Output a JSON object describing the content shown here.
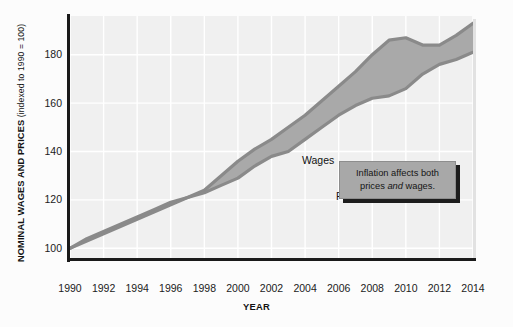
{
  "chart_data": {
    "type": "area",
    "title": "",
    "xlabel": "YEAR",
    "ylabel": "NOMINAL WAGES AND PRICES",
    "ylabel_note": "(indexed to 1990 = 100)",
    "xlim": [
      1990,
      2014
    ],
    "ylim": [
      96,
      196
    ],
    "yticks": [
      100,
      120,
      140,
      160,
      180
    ],
    "xticks": [
      1990,
      1992,
      1994,
      1996,
      1998,
      2000,
      2002,
      2004,
      2006,
      2008,
      2010,
      2012,
      2014
    ],
    "grid": true,
    "legend_position": "inline-labels",
    "x": [
      1990,
      1991,
      1992,
      1993,
      1994,
      1995,
      1996,
      1997,
      1998,
      1999,
      2000,
      2001,
      2002,
      2003,
      2004,
      2005,
      2006,
      2007,
      2008,
      2009,
      2010,
      2011,
      2012,
      2013,
      2014
    ],
    "series": [
      {
        "name": "Wages",
        "color": "#8a8a8a",
        "values": [
          100,
          104,
          107,
          110,
          113,
          116,
          119,
          121,
          124,
          130,
          136,
          141,
          145,
          150,
          155,
          161,
          167,
          173,
          180,
          186,
          187,
          184,
          184,
          188,
          193
        ]
      },
      {
        "name": "Prices",
        "color": "#8a8a8a",
        "values": [
          100,
          103,
          106,
          109,
          112,
          115,
          118,
          121,
          123,
          126,
          129,
          134,
          138,
          140,
          145,
          150,
          155,
          159,
          162,
          163,
          166,
          172,
          176,
          178,
          181
        ]
      }
    ],
    "band_fill": "#a9a9a9",
    "panel_background": "#f0f0f0",
    "gridline_color": "#ffffff",
    "annotations": [
      {
        "name": "inflation-callout",
        "line1": "Inflation affects both",
        "line2_pre": "prices ",
        "line2_em": "and",
        "line2_post": " wages."
      }
    ]
  },
  "labels": {
    "ylabel_main": "NOMINAL WAGES AND PRICES",
    "ylabel_sub": " (indexed to 1990 = 100)",
    "xlabel": "YEAR",
    "series_wages": "Wages",
    "series_prices": "Prices"
  },
  "yticks": [
    "180",
    "160",
    "140",
    "120",
    "100"
  ],
  "xticks": [
    "1990",
    "1992",
    "1994",
    "1996",
    "1998",
    "2000",
    "2002",
    "2004",
    "2006",
    "2008",
    "2010",
    "2012",
    "2014"
  ],
  "callout": {
    "line1": "Inflation affects both",
    "line2_pre": "prices ",
    "line2_em": "and",
    "line2_post": " wages."
  }
}
